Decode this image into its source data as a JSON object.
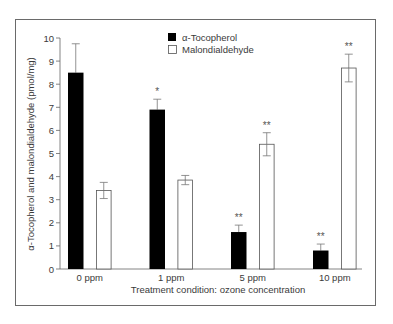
{
  "chart_data": {
    "type": "bar",
    "title": "",
    "xlabel": "Treatment condition: ozone concentration",
    "ylabel": "α-Tocopherol and malondialdehyde (pmol/mg)",
    "ylim": [
      0,
      10
    ],
    "yticks": [
      0,
      1,
      2,
      3,
      4,
      5,
      6,
      7,
      8,
      9,
      10
    ],
    "grid": false,
    "legend_position": "top-center",
    "categories": [
      "0 ppm",
      "1 ppm",
      "5 ppm",
      "10 ppm"
    ],
    "series": [
      {
        "name": "α-Tocopherol",
        "fill": "#000000",
        "values": [
          8.5,
          6.9,
          1.6,
          0.8
        ],
        "error": [
          1.25,
          0.45,
          0.3,
          0.28
        ],
        "significance": [
          "",
          "*",
          "**",
          "**"
        ]
      },
      {
        "name": "Malondialdehyde",
        "fill": "#ffffff",
        "values": [
          3.4,
          3.85,
          5.4,
          8.7
        ],
        "error": [
          0.35,
          0.2,
          0.5,
          0.6
        ],
        "significance": [
          "",
          "",
          "**",
          "**"
        ]
      }
    ]
  },
  "legend": {
    "items": [
      {
        "label": "α-Tocopherol"
      },
      {
        "label": "Malondialdehyde"
      }
    ]
  },
  "axes": {
    "xlabel": "Treatment condition: ozone concentration",
    "ylabel": "α-Tocopherol and malondialdehyde (pmol/mg)"
  }
}
